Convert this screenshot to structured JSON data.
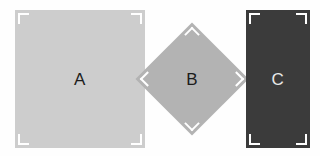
{
  "canvas": {
    "width": 320,
    "height": 156,
    "background_color": "#fefefe"
  },
  "shapes": [
    {
      "id": "shape-a",
      "label": "A",
      "kind": "square",
      "fill_color": "#cdcdcd",
      "label_color": "#1c1c1c",
      "x": 15,
      "y": 10,
      "width": 130,
      "height": 138,
      "rotation_deg": 0,
      "corner_marks": 4,
      "corner_mark_color": "#ffffff"
    },
    {
      "id": "shape-b",
      "label": "B",
      "kind": "diamond",
      "fill_color": "#b3b3b3",
      "label_color": "#1c1c1c",
      "x": 152,
      "y": 39,
      "width": 80,
      "height": 80,
      "rotation_deg": 45,
      "corner_marks": 4,
      "corner_mark_color": "#ffffff"
    },
    {
      "id": "shape-c",
      "label": "C",
      "kind": "rectangle",
      "fill_color": "#3b3b3b",
      "label_color": "#e8e8e8",
      "x": 246,
      "y": 10,
      "width": 64,
      "height": 138,
      "rotation_deg": 0,
      "corner_marks": 4,
      "corner_mark_color": "#ffffff"
    }
  ]
}
